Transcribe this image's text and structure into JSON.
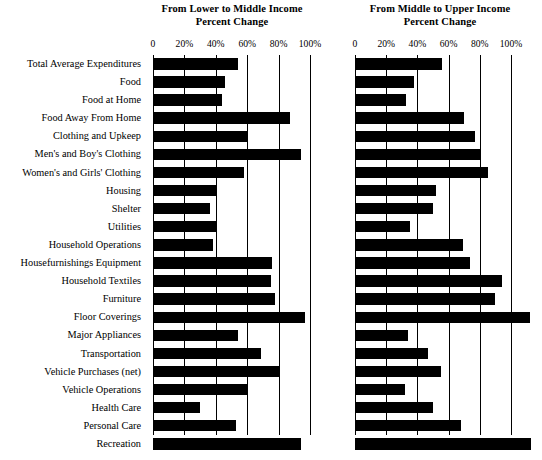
{
  "figure": {
    "axis_label_suffix": "%",
    "zero_label": "0"
  },
  "panels": [
    {
      "title_line1": "From Lower to Middle Income",
      "title_line2": "Percent Change",
      "tick_labels": [
        "0",
        "20%",
        "40%",
        "60%",
        "80%",
        "100%"
      ]
    },
    {
      "title_line1": "From Middle to Upper Income",
      "title_line2": "Percent Change",
      "tick_labels": [
        "0",
        "20%",
        "40%",
        "60%",
        "80%",
        "100%"
      ]
    }
  ],
  "chart_data": {
    "type": "bar",
    "orientation": "horizontal",
    "xlabel": "Percent Change",
    "ylabel": "",
    "grid": true,
    "legend_position": "none",
    "xlim": [
      0,
      100
    ],
    "xticks": [
      0,
      20,
      40,
      60,
      80,
      100
    ],
    "xtick_labels": [
      "0",
      "20%",
      "40%",
      "60%",
      "80%",
      "100%"
    ],
    "bar_color": "#000000",
    "categories": [
      "Total Average Expenditures",
      "Food",
      "Food at Home",
      "Food Away From Home",
      "Clothing and Upkeep",
      "Men's and Boy's Clothing",
      "Women's and Girls' Clothing",
      "Housing",
      "Shelter",
      "Utilities",
      "Household Operations",
      "Housefurnishings Equipment",
      "Household Textiles",
      "Furniture",
      "Floor Coverings",
      "Major Appliances",
      "Transportation",
      "Vehicle Purchases (net)",
      "Vehicle Operations",
      "Health Care",
      "Personal Care",
      "Recreation"
    ],
    "series": [
      {
        "name": "From Lower to Middle Income",
        "values": [
          54,
          46,
          44,
          87,
          60,
          94,
          58,
          41,
          36,
          40,
          38,
          76,
          75,
          78,
          97,
          54,
          69,
          80,
          60,
          30,
          53,
          94
        ]
      },
      {
        "name": "From Middle to Upper Income",
        "values": [
          56,
          38,
          33,
          70,
          77,
          81,
          85,
          52,
          50,
          35,
          69,
          74,
          94,
          90,
          112,
          34,
          47,
          55,
          32,
          50,
          68,
          113
        ]
      }
    ]
  }
}
